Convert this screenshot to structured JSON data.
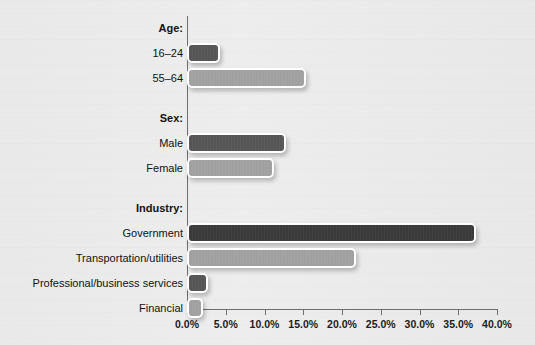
{
  "chart_data": {
    "type": "bar",
    "orientation": "horizontal",
    "title": "",
    "subtitle": "",
    "xlabel": "",
    "ylabel": "",
    "xlim": [
      0,
      40
    ],
    "xtick_labels": [
      "0.0%",
      "5.0%",
      "10.0%",
      "15.0%",
      "20.0%",
      "25.0%",
      "30.0%",
      "35.0%",
      "40.0%"
    ],
    "xticks": [
      0,
      5,
      10,
      15,
      20,
      25,
      30,
      35,
      40
    ],
    "grid": false,
    "legend": "none",
    "groups": [
      {
        "label": "Age:",
        "rows": [
          {
            "label": "16–24",
            "value": 3.8,
            "shade": "dark"
          },
          {
            "label": "55–64",
            "value": 14.8,
            "shade": "light"
          }
        ]
      },
      {
        "label": "Sex:",
        "rows": [
          {
            "label": "Male",
            "value": 12.3,
            "shade": "dark"
          },
          {
            "label": "Female",
            "value": 10.7,
            "shade": "light"
          }
        ]
      },
      {
        "label": "Industry:",
        "rows": [
          {
            "label": "Government",
            "value": 36.8,
            "shade": "darkest"
          },
          {
            "label": "Transportation/utilities",
            "value": 21.3,
            "shade": "light"
          },
          {
            "label": "Professional/business services",
            "value": 2.2,
            "shade": "dark"
          },
          {
            "label": "Financial",
            "value": 1.6,
            "shade": "light"
          }
        ]
      }
    ],
    "categories": [
      "16–24",
      "55–64",
      "Male",
      "Female",
      "Government",
      "Transportation/utilities",
      "Professional/business services",
      "Financial"
    ],
    "values": [
      3.8,
      14.8,
      12.3,
      10.7,
      36.8,
      21.3,
      2.2,
      1.6
    ],
    "colors": {
      "darkest": "#3a3a3a",
      "dark": "#555555",
      "light": "#a0a0a0",
      "background": "#ebebeb",
      "axis": "#6e6e6e",
      "text": "#121212",
      "bar_outline": "#ffffff"
    }
  }
}
